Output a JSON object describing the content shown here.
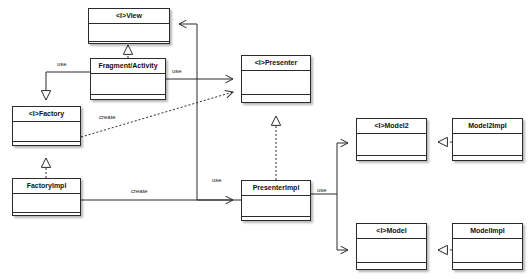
{
  "diagram": {
    "title_watermark": "",
    "type": "uml-class-diagram",
    "stroke_color": "#2b2b2b",
    "fill_color": "#ffffff",
    "label_color": "#1a1a1a"
  },
  "classes": [
    {
      "id": "view",
      "name": "<I>View",
      "x": 88,
      "y": 8,
      "w": 82,
      "h": 36
    },
    {
      "id": "fragment",
      "name": "Fragment/Activity",
      "x": 90,
      "y": 58,
      "w": 76,
      "h": 42
    },
    {
      "id": "factory",
      "name": "<I>Factory",
      "x": 12,
      "y": 106,
      "w": 69,
      "h": 40
    },
    {
      "id": "factoryimpl",
      "name": "FactoryImpl",
      "x": 12,
      "y": 178,
      "w": 69,
      "h": 38
    },
    {
      "id": "presenter",
      "name": "<I>Presenter",
      "x": 241,
      "y": 55,
      "w": 70,
      "h": 48
    },
    {
      "id": "presenterimpl",
      "name": "PresenterImpl",
      "x": 241,
      "y": 180,
      "w": 70,
      "h": 41
    },
    {
      "id": "model2",
      "name": "<I>Model2",
      "x": 356,
      "y": 118,
      "w": 71,
      "h": 43
    },
    {
      "id": "model2impl",
      "name": "Model2Impl",
      "x": 452,
      "y": 118,
      "w": 71,
      "h": 43
    },
    {
      "id": "model",
      "name": "<I>Model",
      "x": 356,
      "y": 223,
      "w": 71,
      "h": 47
    },
    {
      "id": "modelimpl",
      "name": "ModelImpl",
      "x": 452,
      "y": 223,
      "w": 71,
      "h": 47
    }
  ],
  "edges": [
    {
      "id": "fragment-realizes-view",
      "from": "fragment",
      "to": "view",
      "kind": "realization",
      "label": ""
    },
    {
      "id": "fragment-uses-factory",
      "from": "fragment",
      "to": "factory",
      "kind": "association-arrow",
      "label": "use"
    },
    {
      "id": "fragment-uses-presenter",
      "from": "fragment",
      "to": "presenter",
      "kind": "association-arrow",
      "label": "use"
    },
    {
      "id": "presenterimpl-knows-view",
      "from": "presenterimpl",
      "to": "view",
      "kind": "association-arrow",
      "label": ""
    },
    {
      "id": "factory-creates-presenter",
      "from": "factory",
      "to": "presenter",
      "kind": "dependency",
      "label": "create"
    },
    {
      "id": "factoryimpl-realizes-factory",
      "from": "factoryimpl",
      "to": "factory",
      "kind": "realization",
      "label": ""
    },
    {
      "id": "factoryimpl-creates-presenterimpl",
      "from": "factoryimpl",
      "to": "presenterimpl",
      "kind": "association-arrow",
      "label": "create"
    },
    {
      "id": "presenterimpl-realizes-presenter",
      "from": "presenterimpl",
      "to": "presenter",
      "kind": "realization",
      "label": ""
    },
    {
      "id": "presenterimpl-uses-model2",
      "from": "presenterimpl",
      "to": "model2",
      "kind": "association-arrow",
      "label": "use"
    },
    {
      "id": "presenterimpl-uses-model",
      "from": "presenterimpl",
      "to": "model",
      "kind": "association-arrow",
      "label": ""
    },
    {
      "id": "model2impl-realizes-model2",
      "from": "model2impl",
      "to": "model2",
      "kind": "realization",
      "label": ""
    },
    {
      "id": "modelimpl-realizes-model",
      "from": "modelimpl",
      "to": "model",
      "kind": "realization",
      "label": ""
    }
  ],
  "edge_labels": [
    {
      "id": "lbl-use-factory",
      "text": "use",
      "x": 57,
      "y": 61
    },
    {
      "id": "lbl-use-presenter",
      "text": "use",
      "x": 172,
      "y": 68
    },
    {
      "id": "lbl-create-top",
      "text": "create",
      "x": 99,
      "y": 114
    },
    {
      "id": "lbl-use-mid",
      "text": "use",
      "x": 212,
      "y": 177
    },
    {
      "id": "lbl-create-bottom",
      "text": "create",
      "x": 131,
      "y": 188
    },
    {
      "id": "lbl-use-model",
      "text": "use",
      "x": 317,
      "y": 187
    }
  ]
}
